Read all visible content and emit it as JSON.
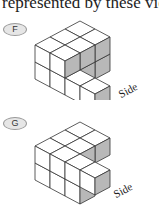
{
  "header": {
    "text": "represented by these vie"
  },
  "options": [
    {
      "label": "F",
      "side_label": "Side",
      "cubes": [
        [
          0,
          0,
          0
        ],
        [
          0,
          0,
          1
        ],
        [
          0,
          1,
          0
        ],
        [
          0,
          1,
          1
        ],
        [
          0,
          2,
          0
        ],
        [
          0,
          2,
          1
        ],
        [
          1,
          0,
          0
        ],
        [
          1,
          0,
          1
        ],
        [
          1,
          1,
          0
        ],
        [
          1,
          1,
          1
        ],
        [
          1,
          2,
          0
        ],
        [
          1,
          2,
          1
        ],
        [
          2,
          2,
          0
        ],
        [
          3,
          2,
          0
        ]
      ]
    },
    {
      "label": "G",
      "side_label": "Side",
      "cubes": [
        [
          0,
          0,
          0
        ],
        [
          0,
          0,
          1
        ],
        [
          0,
          1,
          0
        ],
        [
          0,
          1,
          1
        ],
        [
          0,
          2,
          0
        ],
        [
          0,
          2,
          1
        ],
        [
          1,
          0,
          1
        ],
        [
          1,
          1,
          1
        ],
        [
          1,
          2,
          0
        ],
        [
          1,
          2,
          1
        ],
        [
          2,
          2,
          0
        ],
        [
          2,
          2,
          1
        ],
        [
          3,
          2,
          1
        ]
      ]
    }
  ],
  "colors": {
    "face": "#ffffff",
    "shade": "#b8b8b8",
    "line": "#333333"
  }
}
